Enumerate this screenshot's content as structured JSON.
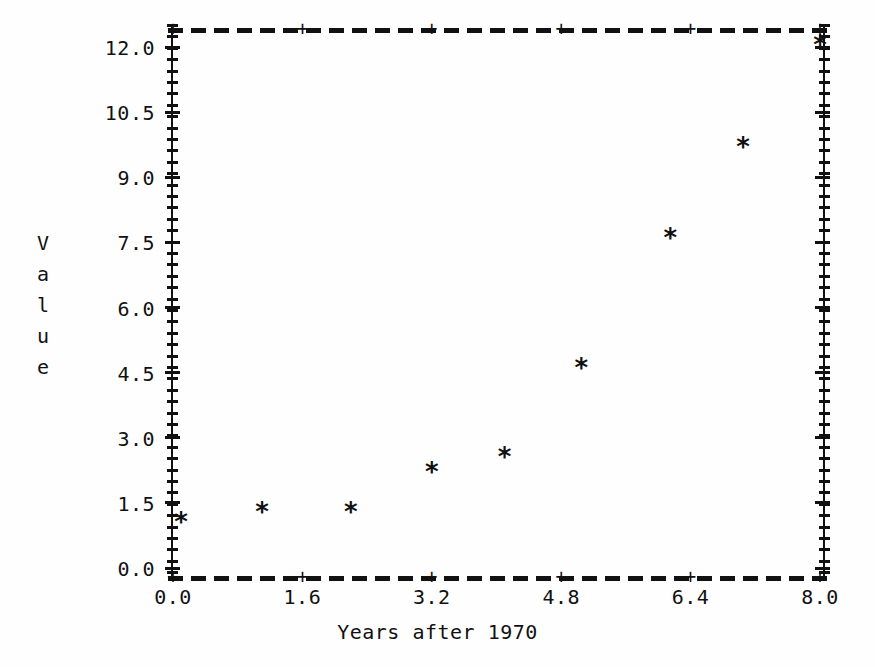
{
  "figure": {
    "marker_glyph": "*",
    "plus_glyph": "+",
    "ink_color": "#111111",
    "background_color": "#fefefe"
  },
  "chart_data": {
    "type": "scatter",
    "title": "",
    "xlabel": "Years after 1970",
    "ylabel": "Value",
    "ylabel_stacked": [
      "V",
      "a",
      "l",
      "u",
      "e"
    ],
    "xlim": [
      0.0,
      8.0
    ],
    "ylim": [
      0.0,
      12.0
    ],
    "xticks": [
      0.0,
      1.6,
      3.2,
      4.8,
      6.4,
      8.0
    ],
    "xtick_labels": [
      "0.0",
      "1.6",
      "3.2",
      "4.8",
      "6.4",
      "8.0"
    ],
    "yticks": [
      0.0,
      1.5,
      3.0,
      4.5,
      6.0,
      7.5,
      9.0,
      10.5,
      12.0
    ],
    "ytick_labels": [
      "0.0",
      "1.5",
      "3.0",
      "4.5",
      "6.0",
      "7.5",
      "9.0",
      "10.5",
      "12.0"
    ],
    "grid": false,
    "legend": null,
    "x": [
      0.1,
      1.1,
      2.2,
      3.2,
      4.1,
      5.05,
      6.15,
      7.05,
      8.0
    ],
    "y": [
      1.05,
      1.3,
      1.3,
      2.2,
      2.55,
      4.6,
      7.6,
      9.7,
      12.05
    ],
    "points": [
      {
        "x": 0.1,
        "y": 1.05
      },
      {
        "x": 1.1,
        "y": 1.3
      },
      {
        "x": 2.2,
        "y": 1.3
      },
      {
        "x": 3.2,
        "y": 2.2
      },
      {
        "x": 4.1,
        "y": 2.55
      },
      {
        "x": 5.05,
        "y": 4.6
      },
      {
        "x": 6.15,
        "y": 7.6
      },
      {
        "x": 7.05,
        "y": 9.7
      },
      {
        "x": 8.0,
        "y": 12.05
      }
    ]
  }
}
